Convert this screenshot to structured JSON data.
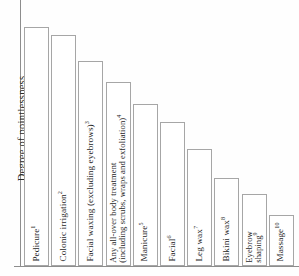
{
  "chart_data": {
    "type": "bar",
    "title": "",
    "subtitle": "",
    "xlabel": "",
    "ylabel": "Degree of pointlessness",
    "grid": false,
    "legend": false,
    "axis_note": "y-axis is unlabelled / unitless ordinal scale; bars sorted descending",
    "ylim": [
      0,
      100
    ],
    "categories": [
      "Pedicure",
      "Colonic irrigation",
      "Facial waxing (excluding eyebrows)",
      "Any all-over body treatment (including scrubs, wraps and exfoliation)",
      "Manicure",
      "Facial",
      "Leg wax",
      "Bikini wax",
      "Eyebrow shaping",
      "Massage"
    ],
    "footnote_markers": [
      "1",
      "2",
      "3",
      "4",
      "5",
      "6",
      "7",
      "8",
      "9",
      "10"
    ],
    "values": [
      90,
      87,
      77,
      69,
      61,
      54,
      44,
      33,
      27,
      19
    ],
    "bar_color": "#ffffff",
    "bar_border_color": "#a6a6a6",
    "axis_color": "#8d8d8d",
    "text_color": "#1f1f1f",
    "background_color": "#fefefe"
  },
  "bars": [
    {
      "label": "Pedicure",
      "sup": "1",
      "value": 90,
      "two_line": false,
      "line1": "Pedicure",
      "line2": ""
    },
    {
      "label": "Colonic irrigation",
      "sup": "2",
      "value": 87,
      "two_line": false,
      "line1": "Colonic irrigation",
      "line2": ""
    },
    {
      "label": "Facial waxing (excluding eyebrows)",
      "sup": "3",
      "value": 77,
      "two_line": false,
      "line1": "Facial waxing (excluding eyebrows)",
      "line2": ""
    },
    {
      "label": "Any all-over body treatment (including scrubs, wraps and exfoliation)",
      "sup": "4",
      "value": 69,
      "two_line": true,
      "line1": "Any all-over body treatment",
      "line2": "(including scrubs, wraps and exfoliation)"
    },
    {
      "label": "Manicure",
      "sup": "5",
      "value": 61,
      "two_line": false,
      "line1": "Manicure",
      "line2": ""
    },
    {
      "label": "Facial",
      "sup": "6",
      "value": 54,
      "two_line": false,
      "line1": "Facial",
      "line2": ""
    },
    {
      "label": "Leg wax",
      "sup": "7",
      "value": 44,
      "two_line": false,
      "line1": "Leg wax",
      "line2": ""
    },
    {
      "label": "Bikini wax",
      "sup": "8",
      "value": 33,
      "two_line": false,
      "line1": "Bikini wax",
      "line2": ""
    },
    {
      "label": "Eyebrow shaping",
      "sup": "9",
      "value": 27,
      "two_line": true,
      "line1": "Eyebrow",
      "line2": "shaping"
    },
    {
      "label": "Massage",
      "sup": "10",
      "value": 19,
      "two_line": false,
      "line1": "Massage",
      "line2": ""
    }
  ],
  "axis": {
    "y_title": "Degree of pointlessness"
  }
}
